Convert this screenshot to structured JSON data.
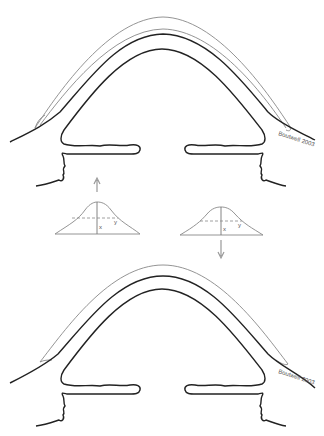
{
  "figure": {
    "type": "schematic",
    "panels": [
      {
        "id": "top-eye",
        "credit": "Boutwell 2003",
        "layers": [
          "outer thin layer",
          "second thin layer",
          "thick layer",
          "inner thick layer"
        ]
      },
      {
        "id": "left-bell",
        "labels": {
          "x": "x",
          "y": "y"
        },
        "arrow": "up"
      },
      {
        "id": "right-bell",
        "labels": {
          "x": "x",
          "y": "y"
        },
        "arrow": "down"
      },
      {
        "id": "bottom-eye",
        "credit": "Boutwell 2003",
        "layers": [
          "outer thin layer",
          "thick layer",
          "inner thick layer"
        ]
      }
    ]
  },
  "colors": {
    "thick_line": "#222222",
    "thin_line": "#777777",
    "arrow": "#999999",
    "label_text": "#555555"
  }
}
